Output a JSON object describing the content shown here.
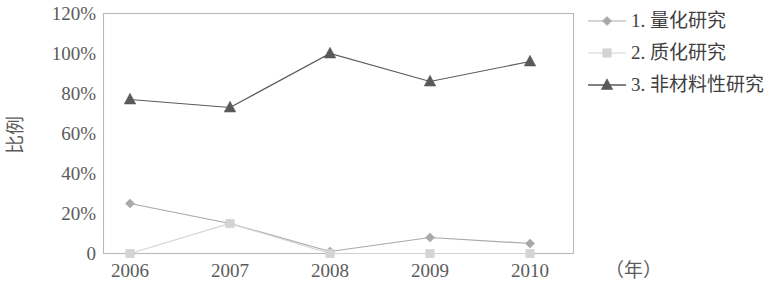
{
  "chart_data": {
    "type": "line",
    "title": "",
    "xlabel": "（年）",
    "ylabel": "比例",
    "categories": [
      "2006",
      "2007",
      "2008",
      "2009",
      "2010"
    ],
    "ylim": [
      0,
      120
    ],
    "ytick_labels": [
      "0",
      "20%",
      "40%",
      "60%",
      "80%",
      "100%",
      "120%"
    ],
    "ytick_values": [
      0,
      20,
      40,
      60,
      80,
      100,
      120
    ],
    "grid": false,
    "legend_position": "right",
    "series": [
      {
        "name": "1. 量化研究",
        "marker": "diamond",
        "color": "#a9a9a9",
        "values": [
          25,
          15,
          1,
          8,
          5
        ]
      },
      {
        "name": "2. 质化研究",
        "marker": "square",
        "color": "#d4d4d4",
        "values": [
          0,
          15,
          0,
          0,
          0
        ]
      },
      {
        "name": "3. 非材料性研究",
        "marker": "triangle",
        "color": "#595959",
        "values": [
          77,
          73,
          100,
          86,
          96
        ]
      }
    ]
  },
  "axis": {
    "y_title": "比例",
    "x_unit": "（年）"
  },
  "legend": {
    "items": [
      {
        "label": "1. 量化研究",
        "marker": "diamond-marker",
        "color": "#a9a9a9"
      },
      {
        "label": "2. 质化研究",
        "marker": "square-marker",
        "color": "#d4d4d4"
      },
      {
        "label": "3. 非材料性研究",
        "marker": "triangle-marker",
        "color": "#595959"
      }
    ]
  },
  "colors": {
    "frame": "#b9b9b9",
    "text": "#5b5b5b",
    "background": "#ffffff"
  }
}
